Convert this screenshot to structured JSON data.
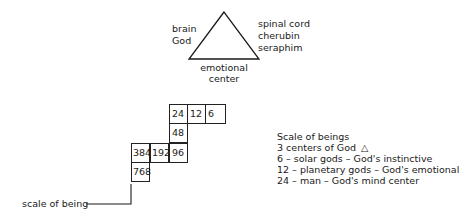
{
  "triangle": {
    "left_labels": [
      "brain",
      "God"
    ],
    "right_labels": [
      "spinal cord",
      "cherubin",
      "seraphim"
    ],
    "bottom_labels": [
      "emotional",
      "center"
    ]
  },
  "grid": {
    "cells": [
      {
        "value": "24",
        "col": 2,
        "row": 0
      },
      {
        "value": "12",
        "col": 3,
        "row": 0
      },
      {
        "value": "6",
        "col": 4,
        "row": 0
      },
      {
        "value": "48",
        "col": 2,
        "row": 1
      },
      {
        "value": "384",
        "col": 0,
        "row": 2
      },
      {
        "value": "192",
        "col": 1,
        "row": 2
      },
      {
        "value": "96",
        "col": 2,
        "row": 2
      },
      {
        "value": "768",
        "col": 0,
        "row": 3
      }
    ],
    "pointer_label": "scale of being"
  },
  "legend": {
    "title": "Scale of beings",
    "lines": [
      "3 centers of God",
      "6 – solar gods – God's instinctive",
      "12 – planetary gods – God's emotional",
      "24 – man – God's mind center"
    ],
    "triangle_symbol": "△"
  }
}
